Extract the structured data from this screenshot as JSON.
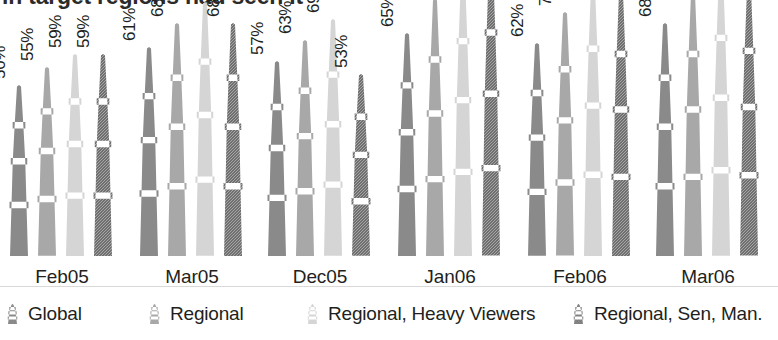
{
  "title": {
    "text": "in target regions had seen it",
    "cropped": true
  },
  "axis": {
    "baseline_color": "#d9d9d9"
  },
  "legend": {
    "position": "bottom",
    "items": [
      {
        "label": "Global",
        "color": "#8a8a8a",
        "textured": false
      },
      {
        "label": "Regional",
        "color": "#a8a8a8",
        "textured": false
      },
      {
        "label": "Regional, Heavy Viewers",
        "color": "#d5d5d5",
        "textured": false
      },
      {
        "label": "Regional, Sen, Man.",
        "color": "#6f6f6f",
        "textured": true
      }
    ]
  },
  "chart_data": {
    "type": "bar",
    "title": "in target regions had seen it",
    "xlabel": "",
    "ylabel": "",
    "ylim": [
      0,
      100
    ],
    "grid": false,
    "value_suffix": "%",
    "value_label_rotation": -90,
    "bar_style": "obelisk",
    "legend_position": "bottom",
    "categories": [
      "Feb05",
      "Mar05",
      "Dec05",
      "Jan06",
      "Feb06",
      "Mar06"
    ],
    "series": [
      {
        "name": "Global",
        "color": "#8a8a8a",
        "values": [
          50,
          61,
          57,
          65,
          62,
          68
        ]
      },
      {
        "name": "Regional",
        "color": "#a8a8a8",
        "values": [
          55,
          68,
          63,
          75,
          71,
          77
        ]
      },
      {
        "name": "Regional, Heavy Viewers",
        "color": "#d5d5d5",
        "values": [
          59,
          74,
          69,
          82,
          79,
          83
        ]
      },
      {
        "name": "Regional, Sen, Man.",
        "color": "#6f6f6f",
        "values": [
          59,
          68,
          53,
          85,
          77,
          78
        ]
      }
    ],
    "value_labels": [
      [
        "50%",
        "55%",
        "59%",
        "59%"
      ],
      [
        "61%",
        "68%",
        "74%",
        "68%"
      ],
      [
        "57%",
        "63%",
        "69%",
        "53%"
      ],
      [
        "65%",
        "75%",
        "82%",
        "85%"
      ],
      [
        "62%",
        "71%",
        "79%",
        "77%"
      ],
      [
        "68%",
        "77%",
        "83%",
        "78%"
      ]
    ]
  },
  "layout": {
    "group_left_positions": [
      6,
      136,
      264,
      394,
      524,
      652
    ],
    "group_width": 112,
    "bar_pitch": 28,
    "px_per_percent": 3.43,
    "baseline_y": 256
  }
}
